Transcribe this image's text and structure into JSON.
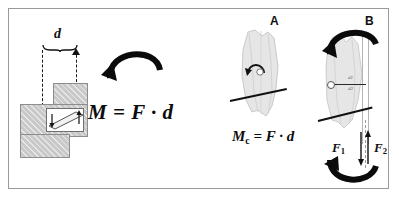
{
  "figure": {
    "background_color": "#ffffff",
    "border_color": "#9a9a9a"
  },
  "left_diagram": {
    "name": "bracket-moment-diagram",
    "distance_label": "d",
    "formula": "M = F · d",
    "formula_parts": {
      "moment": "M",
      "equals": "=",
      "force": "F",
      "dot": "·",
      "distance": "d"
    },
    "rotation_arrow": "clockwise-curved-arrow",
    "force_arrow_down": "force-arrow-down",
    "force_arrow_up": "force-arrow-up",
    "block_fill": "#c9c9c9",
    "block_stroke": "#8d8d8d"
  },
  "tooth_a": {
    "name": "tooth-diagram-a",
    "label": "A",
    "formula": "Mc = F · d",
    "formula_parts": {
      "moment": "M",
      "subscript": "c",
      "equals": "=",
      "force": "F",
      "dot": "·",
      "distance": "d"
    },
    "rotation_marker": "small-rotation-arrow",
    "bone_level": "bone-level-line",
    "tooth_fill": "#e3e3e3"
  },
  "tooth_b": {
    "name": "tooth-diagram-b",
    "label": "B",
    "force_1": "F",
    "force_1_sub": "1",
    "force_2": "F",
    "force_2_sub": "2",
    "distance_1": "d",
    "distance_1_sub": "1",
    "distance_2": "d",
    "distance_2_sub": "2",
    "top_arrow": "clockwise-curved-arrow",
    "bottom_arrow": "counterclockwise-curved-arrow",
    "bone_level": "bone-level-line",
    "tooth_fill": "#e3e3e3"
  }
}
